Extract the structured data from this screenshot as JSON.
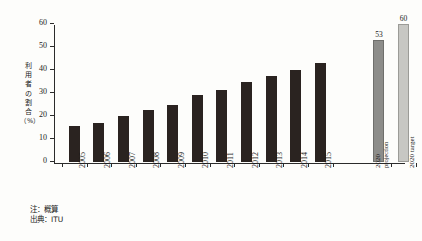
{
  "figure": {
    "background_color": "#fdfdfb",
    "axis_color": "#2b2b2b",
    "bar_color": "#2a2320",
    "projection_bar_color": "#8d8d8a",
    "target_bar_color": "#c7c7c3"
  },
  "ylabel": {
    "chars": [
      "利",
      "用",
      "者",
      "の",
      "割",
      "合"
    ],
    "unit": "（%）"
  },
  "footnotes": {
    "note": "注：概算",
    "source": "出典：ITU"
  },
  "chart_data": {
    "type": "bar",
    "title": "",
    "subtitle": "",
    "xlabel": "",
    "ylabel": "利用者の割合（%）",
    "ylim": [
      0,
      60
    ],
    "yticks": [
      0,
      10,
      20,
      30,
      40,
      50,
      60
    ],
    "ytick_labels": [
      "0",
      "10",
      "20",
      "30",
      "40",
      "50",
      "60"
    ],
    "grid": false,
    "legend": false,
    "categories": [
      "2005",
      "2006",
      "2007",
      "2008",
      "2009",
      "2010",
      "2011",
      "2012",
      "2013",
      "2014",
      "2015",
      "2020 projection",
      "2020 target"
    ],
    "category_labels": [
      {
        "line1": "2005",
        "line2": ""
      },
      {
        "line1": "2006",
        "line2": ""
      },
      {
        "line1": "2007",
        "line2": ""
      },
      {
        "line1": "2008",
        "line2": ""
      },
      {
        "line1": "2009",
        "line2": ""
      },
      {
        "line1": "2010",
        "line2": ""
      },
      {
        "line1": "2011",
        "line2": ""
      },
      {
        "line1": "2012",
        "line2": ""
      },
      {
        "line1": "2013",
        "line2": ""
      },
      {
        "line1": "2014",
        "line2": ""
      },
      {
        "line1": "2015",
        "line2": ""
      },
      {
        "line1": "2020",
        "line2": "projection"
      },
      {
        "line1": "2020 target",
        "line2": ""
      }
    ],
    "values": [
      15.5,
      17,
      20,
      22.5,
      25,
      29,
      31.5,
      35,
      37.5,
      40,
      43,
      53,
      60
    ],
    "value_labels": [
      "",
      "",
      "",
      "",
      "",
      "",
      "",
      "",
      "",
      "",
      "",
      "53",
      "60"
    ],
    "bar_styles": [
      "dark",
      "dark",
      "dark",
      "dark",
      "dark",
      "dark",
      "dark",
      "dark",
      "dark",
      "dark",
      "dark",
      "gray-dark",
      "gray-light"
    ]
  }
}
